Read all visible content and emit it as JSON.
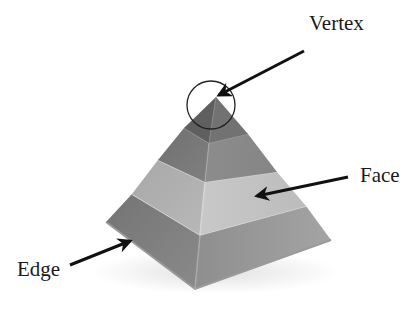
{
  "diagram": {
    "labels": {
      "vertex": "Vertex",
      "face": "Face",
      "edge": "Edge"
    },
    "colors": {
      "background": "#ffffff",
      "text": "#1a1a1a",
      "arrow": "#111111",
      "tier1_left": "#5f5f5f",
      "tier1_right": "#727272",
      "tier2_left": "#7a7a7a",
      "tier2_right": "#8c8c8c",
      "tier3_left": "#adadad",
      "tier3_right": "#c4c4c4",
      "base_left": "#7c7c7c",
      "base_right": "#979797"
    }
  }
}
